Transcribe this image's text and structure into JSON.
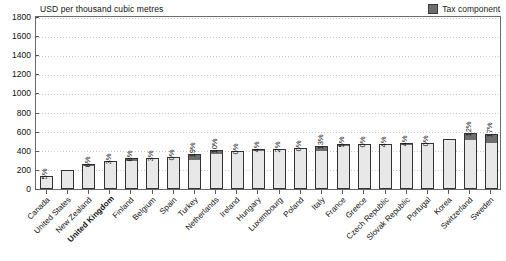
{
  "chart": {
    "axis_title": "USD per thousand cubic metres",
    "legend": [
      {
        "label": "Tax component",
        "color": "#6e6e6e"
      }
    ]
  },
  "chart_data": {
    "type": "bar",
    "title": "",
    "subtitle": "",
    "xlabel": "",
    "ylabel": "USD per thousand cubic metres",
    "ylim": [
      0,
      1800
    ],
    "yticks": [
      0,
      200,
      400,
      600,
      800,
      1000,
      1200,
      1400,
      1600,
      1800
    ],
    "grid": true,
    "legend_position": "top-right",
    "stacked": true,
    "categories": [
      "Canada",
      "United States",
      "New Zealand",
      "United Kingdom",
      "Finland",
      "Belgium",
      "Spain",
      "Turkey",
      "Netherlands",
      "Ireland",
      "Hungary",
      "Luxembourg",
      "Poland",
      "Italy",
      "France",
      "Greece",
      "Czech Republic",
      "Slovak Republic",
      "Portugal",
      "Korea",
      "Switzerland",
      "Sweden"
    ],
    "highlight_category": "United Kingdom",
    "series": [
      {
        "name": "Price excluding tax",
        "color": "#e8e8e8",
        "values": [
          124,
          198,
          244,
          281,
          298,
          317,
          330,
          300,
          369,
          400,
          398,
          412,
          428,
          396,
          447,
          470,
          456,
          462,
          480,
          528,
          513,
          480
        ]
      },
      {
        "name": "Tax component",
        "color": "#6e6e6e",
        "values": [
          7,
          0,
          16,
          9,
          26,
          10,
          0,
          70,
          41,
          0,
          17,
          8,
          0,
          59,
          24,
          0,
          19,
          19,
          0,
          0,
          70,
          98
        ]
      }
    ],
    "totals": [
      131,
      198,
      260,
      290,
      324,
      327,
      330,
      370,
      410,
      400,
      415,
      420,
      428,
      455,
      471,
      470,
      475,
      481,
      480,
      528,
      583,
      578
    ],
    "data_labels": [
      "5%",
      "",
      "6%",
      "3%",
      "8%",
      "3%",
      "0%",
      "19%",
      "10%",
      "0%",
      "4%",
      "2%",
      "0%",
      "13%",
      "5%",
      "0%",
      "4%",
      "4%",
      "0%",
      "",
      "12%",
      "17%"
    ]
  }
}
